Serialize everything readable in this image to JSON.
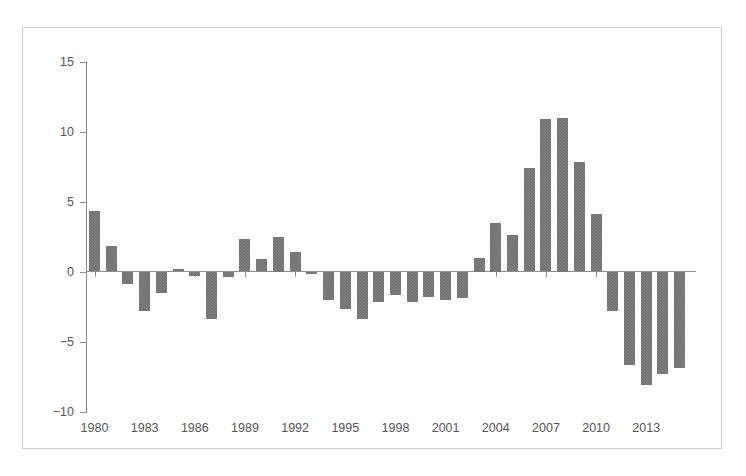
{
  "figure": {
    "title": "",
    "background_color": "#ffffff",
    "frame_color": "#cfcfcf",
    "bar_color": "#6e6e6e",
    "axis_color": "#8a8a8a",
    "tick_label_color": "#555555"
  },
  "chart_data": {
    "type": "bar",
    "title": "",
    "subtitle": "",
    "xlabel": "",
    "ylabel": "",
    "legend": [],
    "legend_position": "none",
    "grid": false,
    "orientation": "vertical",
    "ylim": [
      -10,
      15
    ],
    "yticks": [
      15,
      10,
      5,
      0,
      -5,
      -10
    ],
    "ytick_labels": [
      "15",
      "10",
      "5",
      "0",
      "−5",
      "−10"
    ],
    "xticks": [
      1980,
      1983,
      1986,
      1989,
      1992,
      1995,
      1998,
      2001,
      2004,
      2007,
      2010,
      2013
    ],
    "xtick_labels": [
      "1980",
      "1983",
      "1986",
      "1989",
      "1992",
      "1995",
      "1998",
      "2001",
      "2004",
      "2007",
      "2010",
      "2013"
    ],
    "xlim": [
      1979.3,
      1979.3
    ],
    "categories": [
      "1980",
      "1981",
      "1982",
      "1983",
      "1984",
      "1985",
      "1986",
      "1987",
      "1988",
      "1989",
      "1990",
      "1991",
      "1992",
      "1993",
      "1994",
      "1995",
      "1996",
      "1997",
      "1998",
      "1999",
      "2000",
      "2001",
      "2002",
      "2003",
      "2004",
      "2005",
      "2006",
      "2007",
      "2008",
      "2009",
      "2010",
      "2011",
      "2012",
      "2013",
      "2014",
      "2015"
    ],
    "values": [
      4.3,
      1.8,
      -0.9,
      -2.8,
      -1.5,
      0.15,
      -0.3,
      -3.4,
      -0.4,
      2.3,
      0.9,
      2.5,
      1.4,
      -0.2,
      -2.0,
      -2.7,
      -3.4,
      -2.2,
      -1.7,
      -2.2,
      -1.8,
      -2.0,
      -1.9,
      1.0,
      3.5,
      2.6,
      7.4,
      10.9,
      11.0,
      7.8,
      4.1,
      -2.8,
      -6.7,
      -8.1,
      -7.3,
      -6.9
    ]
  }
}
